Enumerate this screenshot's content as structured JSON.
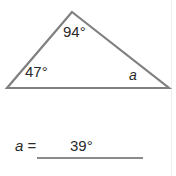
{
  "problem": {
    "figure": {
      "shape_name": "triangle",
      "stroke_color": "#808080",
      "vertices": {
        "apex": {
          "x": 72,
          "y": 12
        },
        "left": {
          "x": 7,
          "y": 88
        },
        "right": {
          "x": 169,
          "y": 88
        }
      },
      "angles": [
        {
          "id": "apex",
          "label": "94°",
          "value": 94,
          "known": true
        },
        {
          "id": "left",
          "label": "47°",
          "value": 47,
          "known": true
        },
        {
          "id": "right",
          "label": "a",
          "value": 39,
          "known": false
        }
      ]
    },
    "answer": {
      "prefix_variable": "a",
      "prefix_equals": "=",
      "value": "39°"
    }
  },
  "colors": {
    "text": "#2a2a2a",
    "figure_stroke": "#808080",
    "answer_rule": "#8a8a8a",
    "page_background": "#ffffff"
  }
}
